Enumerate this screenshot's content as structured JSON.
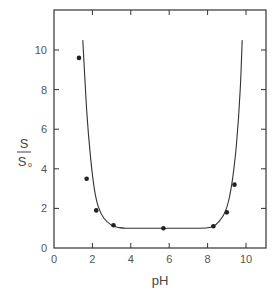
{
  "chart_data": {
    "type": "scatter",
    "title": "",
    "xlabel": "pH",
    "ylabel": "S/S₀",
    "ylabel_parts": {
      "numerator": "S",
      "denominator": "S",
      "denominator_subscript": "o"
    },
    "xlim": [
      0,
      11
    ],
    "ylim": [
      0,
      12
    ],
    "x_ticks": [
      0,
      2,
      4,
      6,
      8,
      10
    ],
    "x_tick_labels": [
      "0",
      "2",
      "4",
      "6",
      "8",
      "10"
    ],
    "y_ticks": [
      0,
      2,
      4,
      6,
      8,
      10
    ],
    "y_tick_labels": [
      "0",
      "2",
      "4",
      "6",
      "8",
      "10"
    ],
    "grid": false,
    "legend": null,
    "series": [
      {
        "name": "measured",
        "style": "markers",
        "x": [
          1.3,
          1.7,
          2.2,
          3.1,
          5.7,
          8.3,
          9.0,
          9.4
        ],
        "y": [
          9.6,
          3.5,
          1.9,
          1.15,
          1.0,
          1.1,
          1.8,
          3.2
        ]
      },
      {
        "name": "fitted curve",
        "style": "line",
        "x": [
          1.5,
          1.7,
          1.9,
          2.1,
          2.3,
          2.6,
          3.0,
          3.4,
          3.8,
          4.5,
          6,
          7.5,
          8.0,
          8.3,
          8.6,
          8.9,
          9.1,
          9.3,
          9.5,
          9.7,
          9.8
        ],
        "y": [
          10.5,
          7.0,
          4.6,
          3.0,
          2.1,
          1.5,
          1.15,
          1.03,
          1.0,
          1.0,
          1.0,
          1.0,
          1.02,
          1.1,
          1.35,
          1.8,
          2.4,
          3.5,
          5.2,
          8.0,
          10.5
        ]
      }
    ]
  }
}
